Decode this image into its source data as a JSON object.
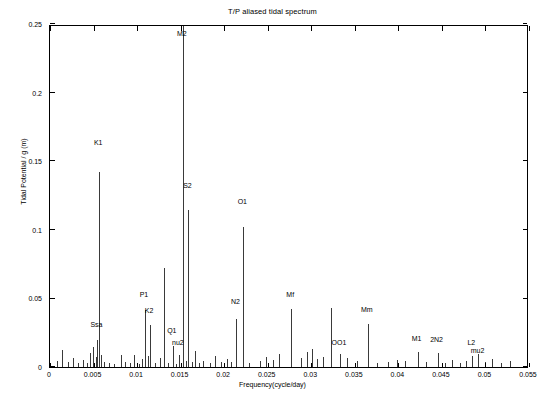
{
  "chart_data": {
    "type": "bar",
    "title": "T/P aliased tidal spectrum",
    "xlabel": "Frequency(cycle/day)",
    "ylabel": "Tidal Potential / g  (m)",
    "xlim": [
      0,
      0.055
    ],
    "ylim": [
      0,
      0.25
    ],
    "xticks": [
      0,
      0.005,
      0.01,
      0.015,
      0.02,
      0.025,
      0.03,
      0.035,
      0.04,
      0.045,
      0.05,
      0.055
    ],
    "xtick_labels": [
      "0",
      "0.005",
      "0.01",
      "0.015",
      "0.02",
      "0.025",
      "0.03",
      "0.035",
      "0.04",
      "0.045",
      "0.05",
      "0.055"
    ],
    "yticks": [
      0,
      0.05,
      0.1,
      0.15,
      0.2,
      0.25
    ],
    "ytick_labels": [
      "0",
      "0.05",
      "0.1",
      "0.15",
      "0.2",
      "0.25"
    ],
    "grid": false,
    "legend": "none",
    "x": [
      0.00085,
      0.0014,
      0.0021,
      0.0026,
      0.0032,
      0.0038,
      0.0042,
      0.0046,
      0.0049,
      0.00525,
      0.00545,
      0.00565,
      0.0058,
      0.0062,
      0.0068,
      0.0073,
      0.0081,
      0.0086,
      0.0092,
      0.0097,
      0.0102,
      0.0106,
      0.0109,
      0.01125,
      0.0115,
      0.0121,
      0.0126,
      0.0131,
      0.0136,
      0.0141,
      0.01445,
      0.0148,
      0.01525,
      0.0156,
      0.0159,
      0.0163,
      0.01665,
      0.0171,
      0.0176,
      0.0184,
      0.019,
      0.0196,
      0.0203,
      0.0208,
      0.0214,
      0.0222,
      0.0229,
      0.0241,
      0.0248,
      0.0256,
      0.0263,
      0.0277,
      0.0288,
      0.0295,
      0.0301,
      0.0306,
      0.0314,
      0.0323,
      0.0333,
      0.0341,
      0.0352,
      0.0365,
      0.0376,
      0.0388,
      0.0398,
      0.0408,
      0.0422,
      0.0432,
      0.0445,
      0.0453,
      0.0462,
      0.0471,
      0.0478,
      0.0485,
      0.0492,
      0.0499,
      0.0508,
      0.0518,
      0.0528
    ],
    "values": [
      0.0043,
      0.0125,
      0.0036,
      0.0068,
      0.0031,
      0.005,
      0.0028,
      0.0101,
      0.0143,
      0.0071,
      0.0196,
      0.1425,
      0.0088,
      0.0039,
      0.0032,
      0.0024,
      0.0086,
      0.0034,
      0.0027,
      0.0084,
      0.0023,
      0.0056,
      0.0415,
      0.008,
      0.0305,
      0.0026,
      0.0063,
      0.0725,
      0.0031,
      0.0154,
      0.0024,
      0.0088,
      0.266,
      0.0042,
      0.1145,
      0.0037,
      0.0115,
      0.0029,
      0.0043,
      0.0026,
      0.0079,
      0.0033,
      0.0062,
      0.0037,
      0.0352,
      0.102,
      0.0029,
      0.0046,
      0.007,
      0.0053,
      0.0098,
      0.042,
      0.0063,
      0.0108,
      0.013,
      0.0058,
      0.0072,
      0.043,
      0.0094,
      0.0063,
      0.0042,
      0.031,
      0.0027,
      0.0038,
      0.0052,
      0.0045,
      0.0112,
      0.0036,
      0.0104,
      0.0029,
      0.0052,
      0.0031,
      0.0046,
      0.0083,
      0.0096,
      0.0034,
      0.0057,
      0.0026,
      0.0041
    ],
    "annotations": [
      {
        "label": "K1",
        "x": 0.00565,
        "y": 0.1425,
        "label_y": 0.161
      },
      {
        "label": "Ssa",
        "x": 0.00545,
        "y": 0.0196,
        "label_y": 0.0285
      },
      {
        "label": "M2",
        "x": 0.01525,
        "y": 0.266,
        "label_y": 0.2405
      },
      {
        "label": "S2",
        "x": 0.0159,
        "y": 0.1145,
        "label_y": 0.13
      },
      {
        "label": "O1",
        "x": 0.0222,
        "y": 0.102,
        "label_y": 0.118
      },
      {
        "label": "P1",
        "x": 0.0109,
        "y": 0.0415,
        "label_y": 0.0505
      },
      {
        "label": "K2",
        "x": 0.0115,
        "y": 0.0305,
        "label_y": 0.0385
      },
      {
        "label": "N2",
        "x": 0.0214,
        "y": 0.0352,
        "label_y": 0.0455
      },
      {
        "label": "Q1",
        "x": 0.0141,
        "y": 0.0154,
        "label_y": 0.024
      },
      {
        "label": "nu2",
        "x": 0.0148,
        "y": 0.0088,
        "label_y": 0.0152
      },
      {
        "label": "Mf",
        "x": 0.0277,
        "y": 0.042,
        "label_y": 0.0505
      },
      {
        "label": "Mm",
        "x": 0.0365,
        "y": 0.031,
        "label_y": 0.0395
      },
      {
        "label": "OO1",
        "x": 0.0333,
        "y": 0.0094,
        "label_y": 0.0155
      },
      {
        "label": "M1",
        "x": 0.0422,
        "y": 0.0112,
        "label_y": 0.018
      },
      {
        "label": "2N2",
        "x": 0.0445,
        "y": 0.0104,
        "label_y": 0.0175
      },
      {
        "label": "L2",
        "x": 0.0485,
        "y": 0.0083,
        "label_y": 0.0155
      },
      {
        "label": "mu2",
        "x": 0.0492,
        "y": 0.0096,
        "label_y": 0.0095
      }
    ]
  },
  "footer": {
    "caption": ""
  }
}
